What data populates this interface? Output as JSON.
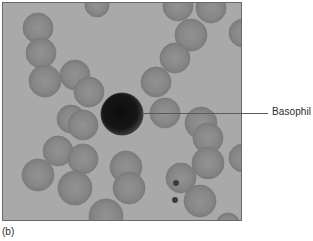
{
  "figure": {
    "panel_label": "(b)",
    "annotation": {
      "label": "Basophil",
      "target": "dark-stained-cell-center"
    },
    "micrograph": {
      "description": "Grayscale blood smear light micrograph showing red blood cells surrounding a single darkly stained basophil",
      "background_color": "#a9a9a9",
      "rbc_color": "#8a8a8a",
      "basophil_color": "#1a1a1a",
      "basophil": {
        "cx": 119,
        "cy": 111,
        "r": 21
      },
      "red_blood_cells": [
        {
          "cx": 35,
          "cy": 25,
          "r": 15
        },
        {
          "cx": 38,
          "cy": 50,
          "r": 15
        },
        {
          "cx": 42,
          "cy": 78,
          "r": 16
        },
        {
          "cx": 72,
          "cy": 72,
          "r": 15
        },
        {
          "cx": 86,
          "cy": 89,
          "r": 15
        },
        {
          "cx": 68,
          "cy": 116,
          "r": 14
        },
        {
          "cx": 80,
          "cy": 122,
          "r": 15
        },
        {
          "cx": 55,
          "cy": 148,
          "r": 15
        },
        {
          "cx": 80,
          "cy": 156,
          "r": 15
        },
        {
          "cx": 35,
          "cy": 172,
          "r": 16
        },
        {
          "cx": 72,
          "cy": 185,
          "r": 17
        },
        {
          "cx": 123,
          "cy": 164,
          "r": 16
        },
        {
          "cx": 126,
          "cy": 185,
          "r": 16
        },
        {
          "cx": 103,
          "cy": 213,
          "r": 17
        },
        {
          "cx": 175,
          "cy": 3,
          "r": 15
        },
        {
          "cx": 208,
          "cy": 5,
          "r": 15
        },
        {
          "cx": 188,
          "cy": 32,
          "r": 16
        },
        {
          "cx": 172,
          "cy": 55,
          "r": 15
        },
        {
          "cx": 153,
          "cy": 79,
          "r": 15
        },
        {
          "cx": 162,
          "cy": 110,
          "r": 15
        },
        {
          "cx": 198,
          "cy": 120,
          "r": 16
        },
        {
          "cx": 205,
          "cy": 135,
          "r": 15
        },
        {
          "cx": 205,
          "cy": 160,
          "r": 16
        },
        {
          "cx": 178,
          "cy": 175,
          "r": 15
        },
        {
          "cx": 197,
          "cy": 198,
          "r": 16
        },
        {
          "cx": 240,
          "cy": 155,
          "r": 14
        },
        {
          "cx": 240,
          "cy": 30,
          "r": 14
        },
        {
          "cx": 225,
          "cy": 222,
          "r": 12
        },
        {
          "cx": 94,
          "cy": 2,
          "r": 12
        }
      ],
      "platelets": [
        {
          "cx": 172,
          "cy": 197,
          "r": 3
        },
        {
          "cx": 173,
          "cy": 180,
          "r": 3
        }
      ]
    }
  }
}
